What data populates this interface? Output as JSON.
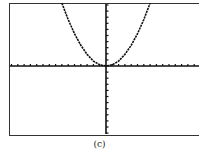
{
  "caption": "(c)",
  "colors": {
    "ink": "#111111",
    "frame": "#333333",
    "background": "#ffffff"
  },
  "chart_data": {
    "type": "line",
    "title": "",
    "xlabel": "",
    "ylabel": "",
    "grid": false,
    "legend": null,
    "axes": {
      "x_ticks_each_side": 15,
      "y_ticks_up": 10,
      "y_ticks_down": 11
    },
    "xlim": [
      -15,
      15
    ],
    "ylim": [
      -11,
      10
    ],
    "series": [
      {
        "name": "y = kx^2",
        "x": [
          -7,
          -6,
          -5,
          -4,
          -3,
          -2,
          -1,
          0,
          1,
          2,
          3,
          4,
          5,
          6,
          7
        ],
        "y": [
          10.3,
          7.6,
          5.3,
          3.4,
          1.9,
          0.8,
          0.2,
          0,
          0.2,
          0.8,
          1.9,
          3.4,
          5.3,
          7.6,
          10.3
        ]
      }
    ]
  }
}
